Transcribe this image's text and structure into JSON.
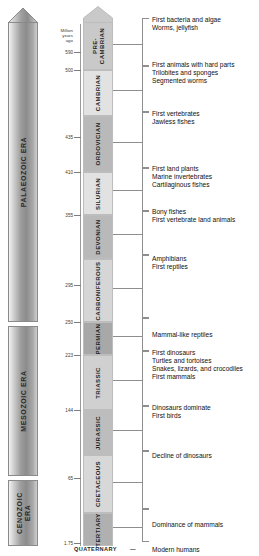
{
  "scale": {
    "caption": "Million\nyears\nago",
    "unit_label": "Million years ago",
    "ticks": [
      {
        "value": "590",
        "y": 52
      },
      {
        "value": "500",
        "y": 70
      },
      {
        "value": "435",
        "y": 137
      },
      {
        "value": "410",
        "y": 172
      },
      {
        "value": "355",
        "y": 215
      },
      {
        "value": "295",
        "y": 285
      },
      {
        "value": "250",
        "y": 322
      },
      {
        "value": "223",
        "y": 355
      },
      {
        "value": "144",
        "y": 410
      },
      {
        "value": "65",
        "y": 478
      },
      {
        "value": "1.75",
        "y": 543
      }
    ]
  },
  "eras": [
    {
      "name": "PALAEOZOIC ERA",
      "top": 22,
      "height": 300,
      "arrow": true,
      "two_line": false
    },
    {
      "name": "MESOZOIC ERA",
      "top": 326,
      "height": 150,
      "arrow": false,
      "two_line": false
    },
    {
      "name": "CENOZOIC\nERA",
      "top": 480,
      "height": 66,
      "arrow": false,
      "two_line": true
    }
  ],
  "periods": [
    {
      "name": "PRE-\nCAMBRIAN",
      "top": 22,
      "height": 48,
      "fill": "#c9c9c9",
      "two_line": true,
      "cap": true
    },
    {
      "name": "CAMBRIAN",
      "top": 70,
      "height": 46,
      "fill": "#e2e2e2",
      "two_line": false,
      "cap": false
    },
    {
      "name": "ORDOVICIAN",
      "top": 116,
      "height": 56,
      "fill": "#b9b9b9",
      "two_line": false,
      "cap": false
    },
    {
      "name": "SILURIAN",
      "top": 172,
      "height": 43,
      "fill": "#e2e2e2",
      "two_line": false,
      "cap": false
    },
    {
      "name": "DEVONIAN",
      "top": 215,
      "height": 44,
      "fill": "#b9b9b9",
      "two_line": false,
      "cap": false
    },
    {
      "name": "CARBONIFEROUS",
      "top": 259,
      "height": 63,
      "fill": "#d6d6d6",
      "two_line": false,
      "cap": false
    },
    {
      "name": "PERMIAN",
      "top": 322,
      "height": 33,
      "fill": "#a8a8a8",
      "two_line": false,
      "cap": false
    },
    {
      "name": "TRIASSIC",
      "top": 355,
      "height": 55,
      "fill": "#d0d0d0",
      "two_line": false,
      "cap": false
    },
    {
      "name": "JURASSIC",
      "top": 410,
      "height": 45,
      "fill": "#bdbdbd",
      "two_line": false,
      "cap": false
    },
    {
      "name": "CRETACEOUS",
      "top": 455,
      "height": 58,
      "fill": "#d8d8d8",
      "two_line": false,
      "cap": false
    },
    {
      "name": "TERTIARY",
      "top": 513,
      "height": 33,
      "fill": "#b0b0b0",
      "two_line": false,
      "cap": false
    }
  ],
  "quaternary": {
    "label": "QUATERNARY",
    "dash": "—",
    "event": "Modern humans",
    "y": 546
  },
  "event_groups": [
    {
      "period": "PRE-CAMBRIAN",
      "text": "First bacteria and algae\nWorms, jellyfish",
      "bracket_top": 18,
      "bracket_height": 48,
      "leader_y": 44,
      "text_top": 16
    },
    {
      "period": "CAMBRIAN",
      "text": "First animals with hard parts\nTrilobites and sponges\nSegmented worms",
      "bracket_top": 66,
      "bracket_height": 46,
      "leader_y": 90,
      "text_top": 61
    },
    {
      "period": "ORDOVICIAN",
      "text": "First vertebrates\nJawless fishes",
      "bracket_top": 112,
      "bracket_height": 56,
      "leader_y": 142,
      "text_top": 110
    },
    {
      "period": "SILURIAN",
      "text": "First land plants\nMarine invertebrates\nCartilaginous fishes",
      "bracket_top": 168,
      "bracket_height": 43,
      "leader_y": 190,
      "text_top": 165
    },
    {
      "period": "DEVONIAN",
      "text": "Bony fishes\nFirst vertebrate land animals",
      "bracket_top": 211,
      "bracket_height": 44,
      "leader_y": 234,
      "text_top": 208
    },
    {
      "period": "CARBONIFEROUS",
      "text": "Amphibians\nFirst reptiles",
      "bracket_top": 255,
      "bracket_height": 63,
      "leader_y": 288,
      "text_top": 255
    },
    {
      "period": "PERMIAN",
      "text": "Mammal-like reptiles",
      "bracket_top": 318,
      "bracket_height": 33,
      "leader_y": 336,
      "text_top": 331
    },
    {
      "period": "TRIASSIC",
      "text": "First dinosaurs\nTurtles and tortoises\nSnakes, lizards, and crocodiles\nFirst mammals",
      "bracket_top": 351,
      "bracket_height": 55,
      "leader_y": 380,
      "text_top": 349
    },
    {
      "period": "JURASSIC",
      "text": "Dinosaurs dominate\nFirst birds",
      "bracket_top": 406,
      "bracket_height": 45,
      "leader_y": 430,
      "text_top": 404
    },
    {
      "period": "CRETACEOUS",
      "text": "Decline of dinosaurs",
      "bracket_top": 451,
      "bracket_height": 58,
      "leader_y": 482,
      "text_top": 452
    },
    {
      "period": "TERTIARY",
      "text": "Dominance of mammals",
      "bracket_top": 509,
      "bracket_height": 33,
      "leader_y": 527,
      "text_top": 521
    }
  ]
}
